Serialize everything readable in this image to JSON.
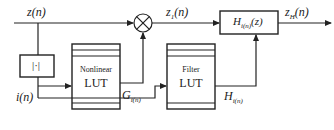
{
  "diagram": {
    "signals": {
      "input": {
        "base": "z",
        "arg": "(n)"
      },
      "multiplier_out": {
        "base": "z",
        "sub": "1",
        "arg": "(n)"
      },
      "output": {
        "base": "z",
        "sub": "H",
        "arg": "(n)"
      },
      "index": {
        "base": "i",
        "arg": "(n)"
      },
      "gain": {
        "base": "G",
        "sub": "i(n)"
      },
      "filter_coeffs": {
        "base": "H",
        "sub": "i(n)"
      }
    },
    "blocks": {
      "abs": {
        "label": "|·|"
      },
      "nonlinear_lut": {
        "line1": "Nonlinear",
        "line2": "LUT"
      },
      "filter_lut": {
        "line1": "Filter",
        "line2": "LUT"
      },
      "filter": {
        "base": "H",
        "sub": "i(n)",
        "arg": "(z)"
      },
      "multiplier": {
        "symbol": "multiply"
      }
    },
    "colors": {
      "line": "#222222",
      "background": "#ffffff"
    }
  }
}
